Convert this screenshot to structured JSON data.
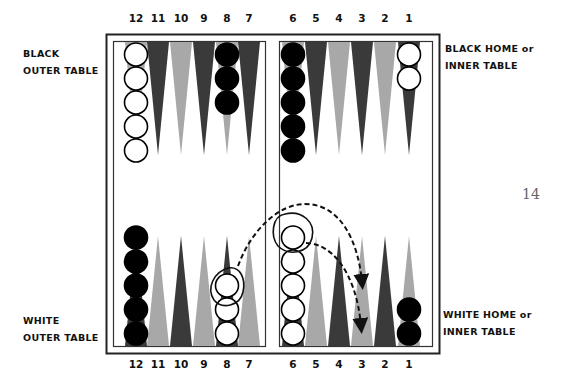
{
  "figure": {
    "page_number": "14"
  },
  "labels": {
    "black_outer": [
      "BLACK",
      "OUTER TABLE"
    ],
    "black_home": [
      "BLACK HOME or",
      "INNER TABLE"
    ],
    "white_outer": [
      "WHITE",
      "OUTER TABLE"
    ],
    "white_home": [
      "WHITE HOME or",
      "INNER TABLE"
    ]
  },
  "point_numbers": {
    "top": [
      "12",
      "11",
      "10",
      "9",
      "8",
      "7",
      "6",
      "5",
      "4",
      "3",
      "2",
      "1"
    ],
    "bottom": [
      "12",
      "11",
      "10",
      "9",
      "8",
      "7",
      "6",
      "5",
      "4",
      "3",
      "2",
      "1"
    ]
  },
  "colors": {
    "dark_point": "#3a3a3a",
    "light_point": "#a8a8a8",
    "frame": "#222222",
    "black_checker": "#000000",
    "white_checker": "#ffffff"
  },
  "board": {
    "top_points": [
      {
        "point": "12",
        "shade": "light",
        "checkers": {
          "color": "white",
          "count": 5
        }
      },
      {
        "point": "11",
        "shade": "dark",
        "checkers": null
      },
      {
        "point": "10",
        "shade": "light",
        "checkers": null
      },
      {
        "point": "9",
        "shade": "dark",
        "checkers": null
      },
      {
        "point": "8",
        "shade": "light",
        "checkers": {
          "color": "black",
          "count": 3
        }
      },
      {
        "point": "7",
        "shade": "dark",
        "checkers": null
      },
      {
        "point": "6",
        "shade": "light",
        "checkers": {
          "color": "black",
          "count": 5
        }
      },
      {
        "point": "5",
        "shade": "dark",
        "checkers": null
      },
      {
        "point": "4",
        "shade": "light",
        "checkers": null
      },
      {
        "point": "3",
        "shade": "dark",
        "checkers": null
      },
      {
        "point": "2",
        "shade": "light",
        "checkers": null
      },
      {
        "point": "1",
        "shade": "dark",
        "checkers": {
          "color": "white",
          "count": 2
        }
      }
    ],
    "bottom_points": [
      {
        "point": "12",
        "shade": "dark",
        "checkers": {
          "color": "black",
          "count": 5
        }
      },
      {
        "point": "11",
        "shade": "light",
        "checkers": null
      },
      {
        "point": "10",
        "shade": "dark",
        "checkers": null
      },
      {
        "point": "9",
        "shade": "light",
        "checkers": null
      },
      {
        "point": "8",
        "shade": "dark",
        "checkers": {
          "color": "white",
          "count": 3
        }
      },
      {
        "point": "7",
        "shade": "light",
        "checkers": null
      },
      {
        "point": "6",
        "shade": "dark",
        "checkers": {
          "color": "white",
          "count": 5
        }
      },
      {
        "point": "5",
        "shade": "light",
        "checkers": null
      },
      {
        "point": "4",
        "shade": "dark",
        "checkers": null
      },
      {
        "point": "3",
        "shade": "light",
        "checkers": null
      },
      {
        "point": "2",
        "shade": "dark",
        "checkers": null
      },
      {
        "point": "1",
        "shade": "light",
        "checkers": {
          "color": "black",
          "count": 2
        }
      }
    ],
    "moves": [
      {
        "from": "8",
        "to": "3",
        "style": "dashed-arrow",
        "highlighted_checker": "top white on point 8"
      },
      {
        "from": "6",
        "to": "3",
        "style": "dashed-arrow",
        "highlighted_checker": "top white on point 6"
      }
    ]
  }
}
